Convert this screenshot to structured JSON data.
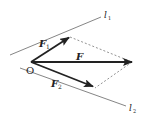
{
  "diagram": {
    "labels": {
      "origin": "O",
      "resultant": "F",
      "component1": "F",
      "component1_sub": "1",
      "component2": "F",
      "component2_sub": "2",
      "line1": "l",
      "line1_sub": "1",
      "line2": "l",
      "line2_sub": "2"
    },
    "colors": {
      "stroke": "#222222",
      "guide": "#666666",
      "dashed": "#777777"
    }
  }
}
